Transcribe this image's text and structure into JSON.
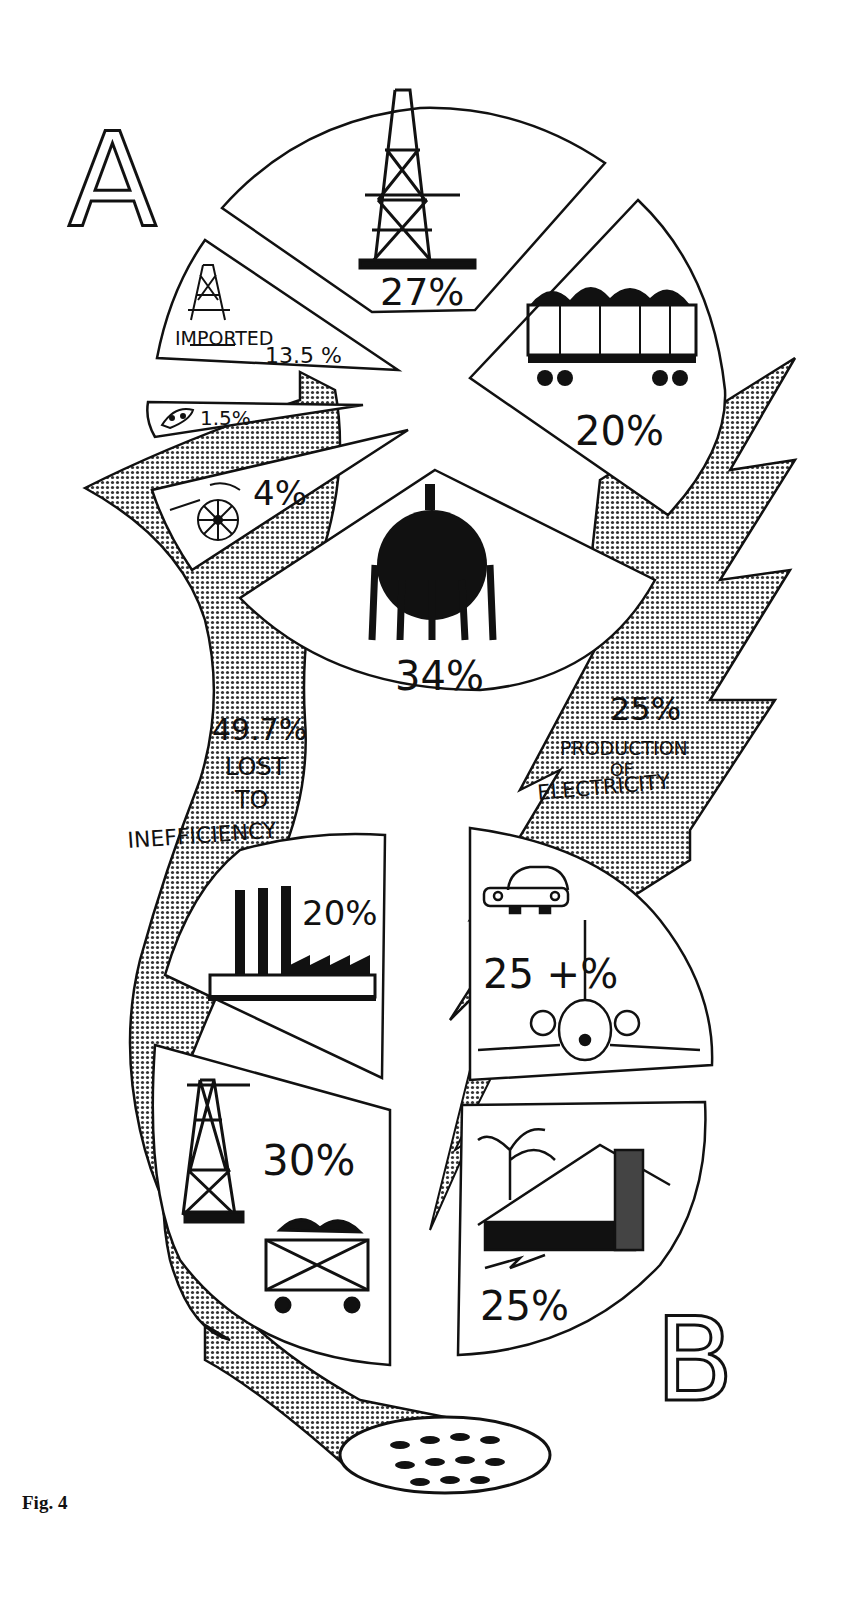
{
  "figure_label": "Fig. 4",
  "section_a": {
    "letter": "A",
    "title": "Energy sources",
    "slices": [
      {
        "icon": "oil-derrick-icon",
        "label": "",
        "value": "27%"
      },
      {
        "icon": "coal-hopper-car-icon",
        "label": "",
        "value": "20%"
      },
      {
        "icon": "gas-storage-sphere-icon",
        "label": "",
        "value": "34%"
      },
      {
        "icon": "water-wheel-icon",
        "label": "",
        "value": "4%"
      },
      {
        "icon": "atom-reactor-icon",
        "label": "",
        "value": "1.5%"
      },
      {
        "icon": "imported-oil-derrick-icon",
        "label": "IMPORTED",
        "value": "13.5 %"
      }
    ]
  },
  "flows": {
    "loss": {
      "value": "49.7%",
      "line1": "LOST",
      "line2": "TO",
      "line3": "INEFFICIENCY"
    },
    "electricity": {
      "value": "25%",
      "line1": "PRODUCTION",
      "line2": "OF",
      "line3": "ELECTRICITY"
    }
  },
  "section_b": {
    "letter": "B",
    "title": "Energy uses",
    "slices": [
      {
        "icon": "factory-icon",
        "value": "20%"
      },
      {
        "icon": "car-and-airplane-icon",
        "value": "25 +%"
      },
      {
        "icon": "mining-derrick-and-coal-cart-icon",
        "value": "30%"
      },
      {
        "icon": "house-and-tree-icon",
        "value": "25%"
      }
    ]
  },
  "sink": {
    "icon": "drain-icon"
  },
  "colors": {
    "ink": "#111111",
    "paper": "#ffffff",
    "halftone": "#9a9a9a"
  }
}
